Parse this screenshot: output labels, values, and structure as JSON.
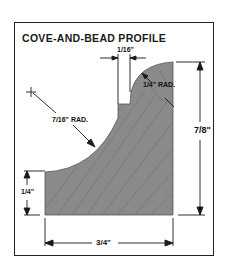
{
  "title": "COVE-AND-BEAD PROFILE",
  "dimensions": {
    "fillet_width": "1/16\"",
    "bead_radius": "1/4\" RAD.",
    "cove_radius": "7/16\" RAD.",
    "total_height": "7/8\"",
    "base_height": "1/4\"",
    "total_width": "3/4\""
  },
  "colors": {
    "wood": "#8c8c8c",
    "wood_grain": "#6e6e6e",
    "line": "#1a1a1a"
  }
}
